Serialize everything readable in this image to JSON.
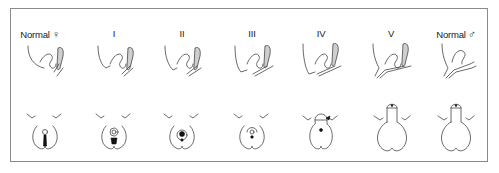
{
  "diagram": {
    "stages": [
      {
        "label": "Normal",
        "symbol": "♀",
        "center_x": 40
      },
      {
        "label": "I",
        "symbol": "",
        "center_x": 114
      },
      {
        "label": "II",
        "symbol": "",
        "center_x": 182
      },
      {
        "label": "III",
        "symbol": "",
        "center_x": 252
      },
      {
        "label": "IV",
        "symbol": "",
        "center_x": 321
      },
      {
        "label": "V",
        "symbol": "",
        "center_x": 391
      },
      {
        "label": "Normal",
        "symbol": "♂",
        "center_x": 456
      }
    ],
    "rows": [
      "sagittal-view",
      "external-view"
    ],
    "colors": {
      "line": "#444444",
      "frame": "#8a8a8a",
      "text": "#222222"
    }
  }
}
